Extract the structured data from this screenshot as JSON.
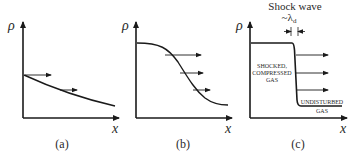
{
  "figure": {
    "panels": [
      {
        "id": "a",
        "caption": "(a)",
        "y_label": "ρ",
        "x_label": "x",
        "description": "Density gently decreasing with x; arrows show propagation"
      },
      {
        "id": "b",
        "caption": "(b)",
        "y_label": "ρ",
        "x_label": "x",
        "description": "Density profile steepening into a wave front"
      },
      {
        "id": "c",
        "caption": "(c)",
        "y_label": "ρ",
        "x_label": "x",
        "title": "Shock wave",
        "thickness_label": "~λ",
        "thickness_subscript": "d",
        "region_left": [
          "SHOCKED,",
          "COMPRESSED",
          "GAS"
        ],
        "region_right": [
          "UNDISTURBED",
          "GAS"
        ]
      }
    ]
  },
  "colors": {
    "line": "#1a1a1a",
    "text": "#2a2a2a",
    "background": "#ffffff"
  }
}
